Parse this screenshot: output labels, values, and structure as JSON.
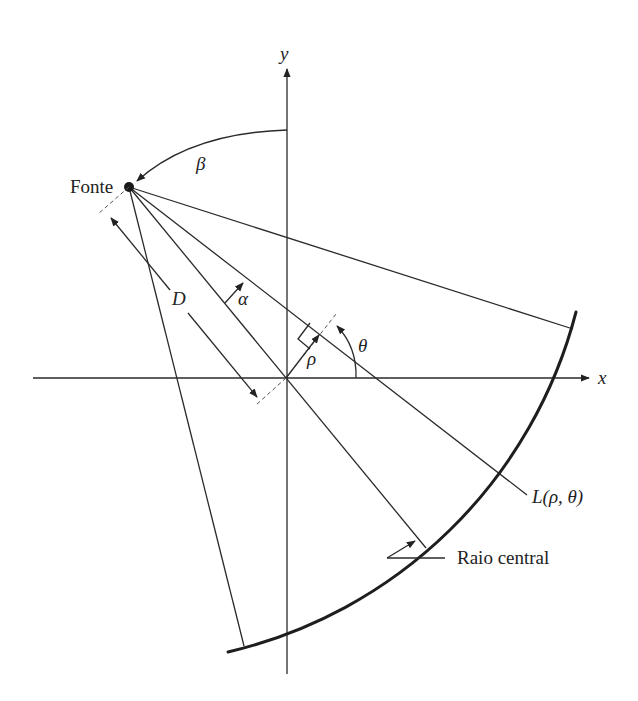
{
  "diagram": {
    "type": "fan-beam CT geometry",
    "labels": {
      "y_axis": "y",
      "x_axis": "x",
      "source": "Fonte",
      "beta": "β",
      "alpha": "α",
      "distance": "D",
      "rho": "ρ",
      "theta": "θ",
      "line": "L(ρ, θ)",
      "central_ray": "Raio central"
    },
    "colors": {
      "ink": "#2a2a2a",
      "background": "#ffffff"
    }
  }
}
